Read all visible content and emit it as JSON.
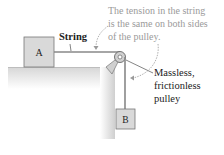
{
  "diagram": {
    "block_a_label": "A",
    "block_b_label": "B",
    "string_label": "String",
    "tension_note": [
      "The tension in the string",
      "is the same on both sides",
      "of the pulley."
    ],
    "pulley_label": [
      "Massless,",
      "frictionless",
      "pulley"
    ]
  }
}
